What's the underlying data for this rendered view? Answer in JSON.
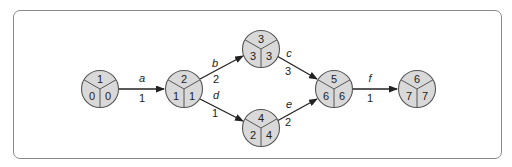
{
  "diagram": {
    "type": "activity-on-arrow network",
    "frame_color": "#8a8a8a",
    "node_fill": "#d9d9d9",
    "nodes": [
      {
        "id": "1",
        "x": 100,
        "y": 89,
        "top": "1",
        "left": "0",
        "right": "0"
      },
      {
        "id": "2",
        "x": 184,
        "y": 89,
        "top": "2",
        "left": "1",
        "right": "1"
      },
      {
        "id": "3",
        "x": 261,
        "y": 49,
        "top": "3",
        "left": "3",
        "right": "3"
      },
      {
        "id": "4",
        "x": 261,
        "y": 128,
        "top": "4",
        "left": "2",
        "right": "4"
      },
      {
        "id": "5",
        "x": 334,
        "y": 89,
        "top": "5",
        "left": "6",
        "right": "6"
      },
      {
        "id": "6",
        "x": 417,
        "y": 89,
        "top": "6",
        "left": "7",
        "right": "7"
      }
    ],
    "edges": [
      {
        "from": "1",
        "to": "2",
        "activity": "a",
        "duration": "1"
      },
      {
        "from": "2",
        "to": "3",
        "activity": "b",
        "duration": "2"
      },
      {
        "from": "2",
        "to": "4",
        "activity": "d",
        "duration": "1"
      },
      {
        "from": "3",
        "to": "5",
        "activity": "c",
        "duration": "3"
      },
      {
        "from": "4",
        "to": "5",
        "activity": "e",
        "duration": "2"
      },
      {
        "from": "5",
        "to": "6",
        "activity": "f",
        "duration": "1"
      }
    ]
  }
}
